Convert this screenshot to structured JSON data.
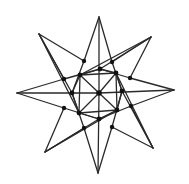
{
  "diagram": {
    "type": "eight-pointed-star-graph",
    "colors": {
      "background": "#ffffff",
      "stroke": "#2a2a2a",
      "node": "#111111"
    },
    "tips": [
      {
        "id": "T0",
        "x": 99,
        "y": 17
      },
      {
        "id": "T1",
        "x": 151,
        "y": 37
      },
      {
        "id": "T2",
        "x": 174,
        "y": 90
      },
      {
        "id": "T3",
        "x": 153,
        "y": 148
      },
      {
        "id": "T4",
        "x": 98,
        "y": 173
      },
      {
        "id": "T5",
        "x": 45,
        "y": 152
      },
      {
        "id": "T6",
        "x": 17,
        "y": 93
      },
      {
        "id": "T7",
        "x": 39,
        "y": 34
      }
    ],
    "center": {
      "id": "C",
      "x": 99,
      "y": 93
    },
    "inner_ring": [
      {
        "id": "A0",
        "x": 100,
        "y": 69
      },
      {
        "id": "A1",
        "x": 116,
        "y": 73
      },
      {
        "id": "A2",
        "x": 122,
        "y": 91
      },
      {
        "id": "A3",
        "x": 117,
        "y": 110
      },
      {
        "id": "A4",
        "x": 99,
        "y": 119
      },
      {
        "id": "A5",
        "x": 79,
        "y": 113
      },
      {
        "id": "A6",
        "x": 72,
        "y": 93
      },
      {
        "id": "A7",
        "x": 80,
        "y": 75
      }
    ],
    "outer_ring": [
      {
        "id": "B0",
        "x": 112,
        "y": 62
      },
      {
        "id": "B1",
        "x": 130,
        "y": 78
      },
      {
        "id": "B2",
        "x": 131,
        "y": 106
      },
      {
        "id": "B3",
        "x": 112,
        "y": 127
      },
      {
        "id": "B4",
        "x": 84,
        "y": 128
      },
      {
        "id": "B5",
        "x": 64,
        "y": 108
      },
      {
        "id": "B6",
        "x": 64,
        "y": 79
      },
      {
        "id": "B7",
        "x": 84,
        "y": 61
      }
    ],
    "edges": [
      [
        "T0",
        "B7"
      ],
      [
        "T0",
        "B0"
      ],
      [
        "T0",
        "C"
      ],
      [
        "T1",
        "B0"
      ],
      [
        "T1",
        "B1"
      ],
      [
        "T1",
        "A7"
      ],
      [
        "T1",
        "A0"
      ],
      [
        "T2",
        "B1"
      ],
      [
        "T2",
        "B2"
      ],
      [
        "T2",
        "C"
      ],
      [
        "T3",
        "B2"
      ],
      [
        "T3",
        "B3"
      ],
      [
        "T3",
        "A1"
      ],
      [
        "T3",
        "A2"
      ],
      [
        "T4",
        "B3"
      ],
      [
        "T4",
        "B4"
      ],
      [
        "T4",
        "C"
      ],
      [
        "T5",
        "B4"
      ],
      [
        "T5",
        "B5"
      ],
      [
        "T5",
        "A3"
      ],
      [
        "T5",
        "A4"
      ],
      [
        "T6",
        "B5"
      ],
      [
        "T6",
        "B6"
      ],
      [
        "T6",
        "C"
      ],
      [
        "T7",
        "B6"
      ],
      [
        "T7",
        "B7"
      ],
      [
        "T7",
        "A5"
      ],
      [
        "T7",
        "A6"
      ],
      [
        "B7",
        "A6"
      ],
      [
        "B0",
        "A2"
      ],
      [
        "B1",
        "A0"
      ],
      [
        "B2",
        "A4"
      ],
      [
        "B3",
        "A2"
      ],
      [
        "B4",
        "A6"
      ],
      [
        "B5",
        "A4"
      ],
      [
        "B6",
        "A0"
      ],
      [
        "A7",
        "A1"
      ],
      [
        "A1",
        "A3"
      ],
      [
        "A3",
        "A5"
      ],
      [
        "A5",
        "A7"
      ],
      [
        "A0",
        "A7"
      ],
      [
        "A0",
        "A1"
      ],
      [
        "A2",
        "A1"
      ],
      [
        "A2",
        "A3"
      ],
      [
        "A4",
        "A3"
      ],
      [
        "A4",
        "A5"
      ],
      [
        "A6",
        "A5"
      ],
      [
        "A6",
        "A7"
      ],
      [
        "C",
        "A1"
      ],
      [
        "C",
        "A3"
      ],
      [
        "C",
        "A5"
      ],
      [
        "C",
        "A7"
      ]
    ]
  }
}
